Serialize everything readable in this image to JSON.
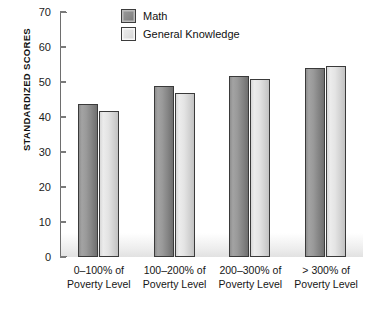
{
  "chart_data": {
    "type": "bar",
    "title": "",
    "xlabel": "",
    "ylabel": "STANDARDIZED SCORES",
    "ylim": [
      0,
      70
    ],
    "ytick_step": 10,
    "yticks": [
      70,
      60,
      50,
      40,
      30,
      20,
      10,
      0
    ],
    "grid": false,
    "legend_position": "top-center",
    "categories": [
      "0–100% of\nPoverty Level",
      "100–200% of\nPoverty Level",
      "200–300% of\nPoverty Level",
      "> 300% of\nPoverty Level"
    ],
    "category_lines": [
      [
        "0–100% of",
        "Poverty Level"
      ],
      [
        "100–200% of",
        "Poverty Level"
      ],
      [
        "200–300% of",
        "Poverty Level"
      ],
      [
        "> 300% of",
        "Poverty Level"
      ]
    ],
    "series": [
      {
        "name": "Math",
        "color": "#8f8f8f",
        "values": [
          43.7,
          48.9,
          51.7,
          53.9
        ]
      },
      {
        "name": "General Knowledge",
        "color": "#e4e4e4",
        "values": [
          41.7,
          46.8,
          50.8,
          54.7
        ]
      }
    ]
  },
  "legend": {
    "items": [
      {
        "label": "Math"
      },
      {
        "label": "General Knowledge"
      }
    ]
  },
  "colors": {
    "math_fill": "#8f8f8f",
    "gk_fill": "#e4e4e4",
    "bar_border": "#3a3a3a",
    "axis": "#6e6e6e",
    "text": "#1a1a1a",
    "background": "#ffffff"
  }
}
